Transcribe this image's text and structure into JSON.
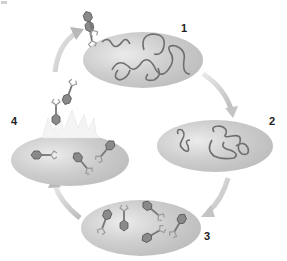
{
  "diagram": {
    "type": "phage-lytic-cycle",
    "colors": {
      "cell_fill": "#c9c9c9",
      "cell_highlight": "#e6e6e6",
      "cell_edge": "#b0b0b0",
      "dna": "#6a6a6a",
      "arrow": "#d4d4d4",
      "phage_head": "#7d7d7d",
      "phage_tail": "#8a8a8a",
      "burst": "#ededed"
    },
    "stages": [
      {
        "id": "1",
        "label": "1",
        "contents": "phage injecting DNA into bacterium"
      },
      {
        "id": "2",
        "label": "2",
        "contents": "bacterial and viral DNA replicating"
      },
      {
        "id": "3",
        "label": "3",
        "contents": "new phages assembling inside cell"
      },
      {
        "id": "4",
        "label": "4",
        "contents": "cell lysis releasing phages"
      }
    ],
    "arrows": [
      {
        "from": "1",
        "to": "2"
      },
      {
        "from": "2",
        "to": "3"
      },
      {
        "from": "3",
        "to": "4"
      },
      {
        "from": "4",
        "to": "1"
      }
    ]
  }
}
